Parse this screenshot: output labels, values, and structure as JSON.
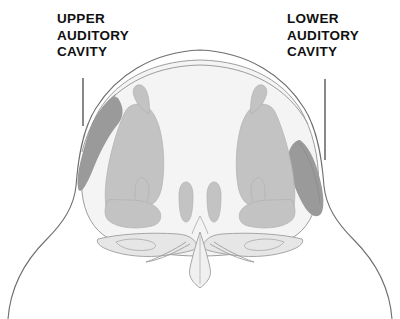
{
  "figure": {
    "type": "anatomical-cross-section",
    "background_color": "#ffffff",
    "outline_color": "#6e6e6e",
    "inner_outline_color": "#9d9d9d",
    "tissue_fill_color": "#c3c3c3",
    "cavity_fill_color": "#9a9a9a",
    "skull_fill_color": "#f2f2f2",
    "leader_line_color": "#3a3a3a",
    "text_color": "#101010"
  },
  "labels": [
    {
      "id": "upper-auditory-cavity",
      "lines": [
        "UPPER",
        "AUDITORY",
        "CAVITY"
      ],
      "line1": "UPPER",
      "line2": "AUDITORY",
      "line3": "CAVITY",
      "leader": {
        "x": 83,
        "y_start": 78,
        "y_end": 126
      }
    },
    {
      "id": "lower-auditory-cavity",
      "lines": [
        "LOWER",
        "AUDITORY",
        "CAVITY"
      ],
      "line1": "LOWER",
      "line2": "AUDITORY",
      "line3": "CAVITY",
      "leader": {
        "x": 325,
        "y_start": 79,
        "y_end": 160
      }
    }
  ]
}
